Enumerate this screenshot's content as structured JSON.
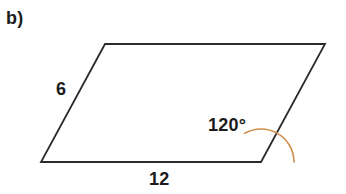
{
  "figure": {
    "part_label": "b)",
    "shape_name": "parallelogram",
    "background_color": "#ffffff",
    "stroke_color": "#2b2b2b",
    "stroke_width": 1.8,
    "arc_color": "#cf8d4e",
    "arc_width": 1.6,
    "arc_radius": 33,
    "vertices": {
      "top_left": {
        "x": 105,
        "y": 44
      },
      "top_right": {
        "x": 325,
        "y": 44
      },
      "bottom_right": {
        "x": 261,
        "y": 162
      },
      "bottom_left": {
        "x": 41,
        "y": 162
      }
    },
    "polygon_points": "105,44 325,44 261,162 41,162",
    "arc_path": "M 294,162 A 33 33 0 0 0 244.5,133.4",
    "labels": {
      "left_side": "6",
      "bottom_side": "12",
      "interior_angle": "120°"
    }
  }
}
